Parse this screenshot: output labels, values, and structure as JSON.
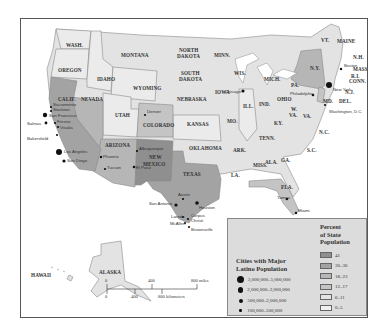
{
  "map": {
    "states": {
      "wash": "WASH.",
      "oregon": "OREGON",
      "calif": "CALIF.",
      "nevada": "NEVADA",
      "idaho": "IDAHO",
      "montana": "MONTANA",
      "wyoming": "WYOMING",
      "utah": "UTAH",
      "colorado": "COLORADO",
      "arizona": "ARIZONA",
      "new_mexico_1": "NEW",
      "new_mexico_2": "MEXICO",
      "north_dakota_1": "NORTH",
      "north_dakota_2": "DAKOTA",
      "south_dakota_1": "SOUTH",
      "south_dakota_2": "DAKOTA",
      "nebraska": "NEBRASKA",
      "kansas": "KANSAS",
      "oklahoma": "OKLAHOMA",
      "texas": "TEXAS",
      "minn": "MINN.",
      "iowa": "IOWA",
      "mo": "MO.",
      "ark": "ARK.",
      "la": "LA.",
      "wis": "WIS.",
      "ill": "ILL.",
      "mich": "MICH.",
      "ind": "IND.",
      "ohio": "OHIO",
      "ky": "KY.",
      "tenn": "TENN.",
      "miss": "MISS.",
      "ala": "ALA.",
      "ga": "GA.",
      "fla": "FLA.",
      "sc": "S.C.",
      "nc": "N.C.",
      "va": "VA.",
      "wva_1": "W.",
      "wva_2": "VA.",
      "pa": "PA.",
      "ny": "N.Y.",
      "vt": "VT.",
      "maine": "MAINE",
      "nh": "N.H.",
      "mass": "MASS.",
      "ri": "R.I.",
      "conn": "CONN.",
      "nj": "N.J.",
      "del": "DEL.",
      "md": "MD.",
      "alaska": "ALASKA",
      "hawaii": "HAWAII"
    },
    "cities": {
      "sacramento": "Sacramento",
      "stockton": "Stockton",
      "san_francisco": "San Francisco",
      "fresno": "Fresno",
      "visalia": "Visalia",
      "salinas": "Salinas",
      "bakersfield": "Bakersfield",
      "los_angeles": "Los Angeles",
      "san_diego": "San Diego",
      "phoenix": "Phoenix",
      "tucson": "Tucson",
      "denver": "Denver",
      "albuquerque": "Albuquerque",
      "el_paso": "El Paso",
      "austin": "Austin",
      "san_antonio": "San Antonio",
      "houston": "Houston",
      "laredo": "Laredo",
      "mcallen": "McAllen",
      "corpus_christi_1": "Corpus",
      "corpus_christi_2": "Christi",
      "brownsville": "Brownsville",
      "chicago": "Chicago",
      "tampa": "Tampa",
      "miami": "Miami",
      "philadelphia": "Philadelphia",
      "new_york": "New York",
      "boston": "Boston",
      "washington_dc": "Washington, D.C."
    },
    "scale": {
      "miles": [
        "0",
        "400",
        "800 miles"
      ],
      "km": [
        "0",
        "400",
        "800 kilometers"
      ]
    }
  },
  "legend": {
    "cities_title_1": "Cities with Major",
    "cities_title_2": "Latino Population",
    "city_sizes": [
      {
        "label": "3,000,000–5,000,000",
        "size": 7
      },
      {
        "label": "2,000,000–3,000,000",
        "size": 5.5
      },
      {
        "label": "500,000–2,000,000",
        "size": 4
      },
      {
        "label": "100,000–500,000",
        "size": 2.5
      }
    ],
    "percent_title_1": "Percent",
    "percent_title_2": "of State",
    "percent_title_3": "Population",
    "percent_bins": [
      {
        "label": "41",
        "color": "#8f8f8f"
      },
      {
        "label": "30–36",
        "color": "#a3a3a3"
      },
      {
        "label": "18–23",
        "color": "#b6b6b6"
      },
      {
        "label": "12–17",
        "color": "#c4c4c4"
      },
      {
        "label": "6–11",
        "color": "#e3e3e3"
      },
      {
        "label": "0–5",
        "color": "#f0f0f0"
      }
    ]
  }
}
